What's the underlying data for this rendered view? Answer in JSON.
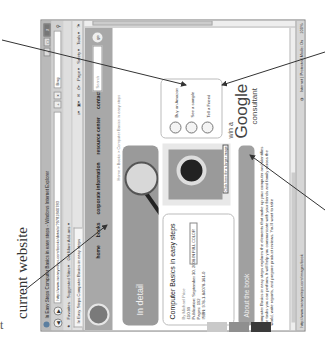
{
  "caption": {
    "text": "current website",
    "fragment": "t"
  },
  "browser": {
    "window_title": "In Easy Steps Computer Basics in easy steps - Windows Internet Explorer",
    "window_buttons": [
      "–",
      "□",
      "X"
    ],
    "address_url": "http://www.ineasysteps.com/books/details/?9781840783",
    "address_icons": [
      "+",
      "x"
    ],
    "search_engine": "Bing",
    "favorites_label": "Favorites",
    "favorites_items": [
      "Suggested Sites ▾",
      "Get More Add-ons ▾"
    ],
    "tab_label": "In Easy Steps Computer Basics in easy steps",
    "command_items": [
      "Page ▾",
      "Safety ▾",
      "Tools ▾",
      "?▾"
    ],
    "status_url": "http://www.ineasysteps.com/images/book",
    "status_zone": "Internet | Protected Mode: On",
    "zoom_level": "100%"
  },
  "site": {
    "nav": [
      "home",
      "books",
      "corporate information",
      "resource center",
      "contact us"
    ],
    "search_placeholder": "Search",
    "go_label": "go",
    "breadcrumb": "Home > Books > Computer Basics in easy steps",
    "banner_label": "In detail",
    "banner_graphic": "in easy steps",
    "book": {
      "title": "Computer Basics in easy steps",
      "author": "By Michael Price",
      "price": "£10.99",
      "publication": "Publication: September 30, 2008",
      "pages": "Pages: 192",
      "isbn": "ISBN: 978-1-84078-361-0",
      "badge": "IN FULL COLOR"
    },
    "cover_tooltip": "Click here for a larger image",
    "cover_title": "Computer Basics",
    "actions": [
      "Buy on Amazon",
      "See a sample",
      "Tell a Friend"
    ],
    "about_heading": "About the book",
    "about_text": "Computer Basics in easy steps explores the elements that make up your computer and identifies the tasks you can perform. It will help you communicate with your friends and family across the world, write reports, and prepare product reviews. You'll want to take",
    "ad": {
      "line1": "win a",
      "line2": "Google",
      "line3": "consultant"
    }
  },
  "swatch_colors": [
    "#c9c9c9",
    "#8f8f8f",
    "#3a3a3a"
  ]
}
